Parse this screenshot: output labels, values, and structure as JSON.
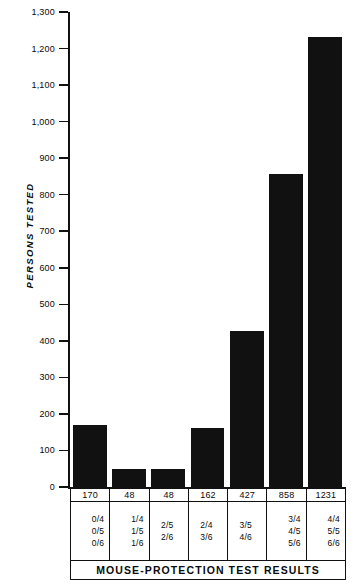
{
  "chart_data": {
    "type": "bar",
    "title": "MOUSE-PROTECTION TEST RESULTS",
    "xlabel": "MOUSE-PROTECTION TEST RESULTS",
    "ylabel": "PERSONS TESTED",
    "ylim": [
      0,
      1300
    ],
    "ytick_values": [
      0,
      100,
      200,
      300,
      400,
      500,
      600,
      700,
      800,
      900,
      1000,
      1100,
      1200,
      1300
    ],
    "ytick_labels": [
      "0",
      "100",
      "200",
      "300",
      "400",
      "500",
      "600",
      "700",
      "800",
      "900",
      "1,000",
      "1,100",
      "1,200",
      "1,300"
    ],
    "grid": false,
    "legend": null,
    "categories": [
      "0/4 0/5 0/6",
      "1/4 1/5 1/6",
      "2/5 2/6",
      "2/4 3/6",
      "3/5 4/6",
      "3/4 4/5 5/6",
      "4/4 5/5 6/6"
    ],
    "values": [
      170,
      48,
      48,
      162,
      427,
      858,
      1231
    ],
    "bar_color": "#111111"
  },
  "table": {
    "value_row": [
      "170",
      "48",
      "48",
      "162",
      "427",
      "858",
      "1231"
    ],
    "fraction_rows": [
      {
        "align": "right",
        "fracs": [
          "0/4",
          "0/5",
          "0/6"
        ]
      },
      {
        "align": "right",
        "fracs": [
          "1/4",
          "1/5",
          "1/6"
        ]
      },
      {
        "align": "center",
        "fracs": [
          "2/5",
          "2/6"
        ]
      },
      {
        "align": "center",
        "fracs": [
          "2/4",
          "3/6"
        ]
      },
      {
        "align": "center",
        "fracs": [
          "3/5",
          "4/6"
        ]
      },
      {
        "align": "right",
        "fracs": [
          "3/4",
          "4/5",
          "5/6"
        ]
      },
      {
        "align": "right",
        "fracs": [
          "4/4",
          "5/5",
          "6/6"
        ]
      }
    ],
    "footer_title": "MOUSE-PROTECTION TEST RESULTS"
  }
}
